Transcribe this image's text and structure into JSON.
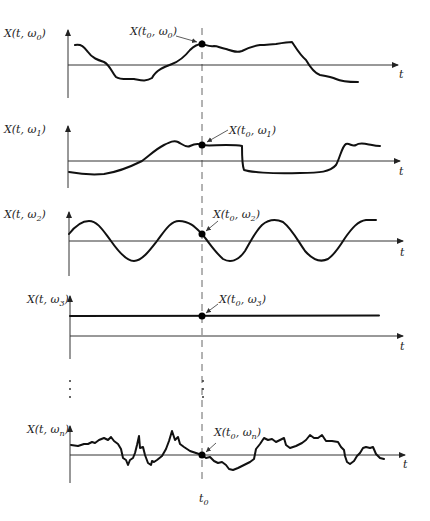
{
  "figure": {
    "time_marker": {
      "label": "t",
      "sub": "0"
    },
    "ellipsis": "⋮",
    "panels": [
      {
        "id": "omega0",
        "y_label": {
          "prefix": "X(t, ω",
          "sub": "0",
          "suffix": ")"
        },
        "point_label": {
          "prefix": "X(t",
          "sub1": "0",
          "mid": ", ω",
          "sub2": "0",
          "suffix": ")"
        },
        "x_label": "t",
        "shape": "smooth random wander"
      },
      {
        "id": "omega1",
        "y_label": {
          "prefix": "X(t, ω",
          "sub": "1",
          "suffix": ")"
        },
        "point_label": {
          "prefix": "X(t",
          "sub1": "0",
          "mid": ", ω",
          "sub2": "1",
          "suffix": ")"
        },
        "x_label": "t",
        "shape": "rise, plateau, step down, step up"
      },
      {
        "id": "omega2",
        "y_label": {
          "prefix": "X(t, ω",
          "sub": "2",
          "suffix": ")"
        },
        "point_label": {
          "prefix": "X(t",
          "sub1": "0",
          "mid": ", ω",
          "sub2": "2",
          "suffix": ")"
        },
        "x_label": "t",
        "shape": "sinusoid"
      },
      {
        "id": "omega3",
        "y_label": {
          "prefix": "X(t, ω",
          "sub": "3",
          "suffix": ")"
        },
        "point_label": {
          "prefix": "X(t",
          "sub1": "0",
          "mid": ", ω",
          "sub2": "3",
          "suffix": ")"
        },
        "x_label": "t",
        "shape": "constant"
      },
      {
        "id": "omegan",
        "y_label": {
          "prefix": "X(t, ω",
          "sub": "n",
          "suffix": ")"
        },
        "point_label": {
          "prefix": "X(t",
          "sub1": "0",
          "mid": ", ω",
          "sub2": "n",
          "suffix": ")"
        },
        "x_label": "t",
        "shape": "jagged noisy"
      }
    ]
  }
}
